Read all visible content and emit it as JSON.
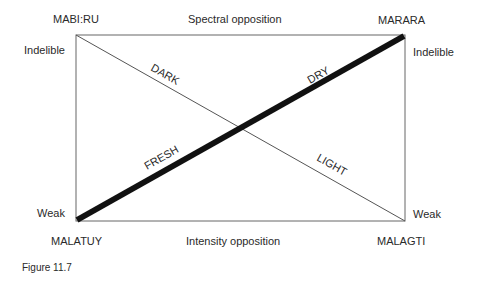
{
  "corners": {
    "top_left": "MABI:RU",
    "top_right": "MARARA",
    "bottom_left": "MALATUY",
    "bottom_right": "MALAGTI"
  },
  "edges": {
    "top": "Spectral opposition",
    "bottom": "Intensity opposition"
  },
  "side_labels": {
    "left_top": "Indelible",
    "left_bottom": "Weak",
    "right_top": "Indelible",
    "right_bottom": "Weak"
  },
  "diagonals": {
    "thick": {
      "upper_label": "DRY",
      "lower_label": "FRESH"
    },
    "thin": {
      "upper_label": "DARK",
      "lower_label": "LIGHT"
    }
  },
  "caption": "Figure 11.7",
  "colors": {
    "line": "#1a1a1a",
    "frame": "#555555",
    "text": "#2a2a2a"
  }
}
